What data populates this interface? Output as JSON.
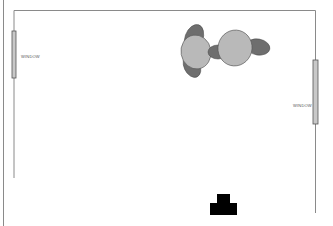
{
  "diagram": {
    "type": "floor-plan",
    "labels": {
      "window_left": "WINDOW",
      "window_right": "WINDOW"
    },
    "colors": {
      "wall": "#8a8a8a",
      "window_fill": "#c8c8c8",
      "window_stroke": "#555555",
      "chair_fill": "#6e6e6e",
      "table_fill": "#b9b9b9",
      "object_fill": "#000000"
    },
    "elements": [
      {
        "kind": "wall",
        "name": "outer-left-wall"
      },
      {
        "kind": "wall",
        "name": "top-wall"
      },
      {
        "kind": "wall",
        "name": "inner-left-wall"
      },
      {
        "kind": "wall",
        "name": "right-wall"
      },
      {
        "kind": "window",
        "name": "left-window",
        "label": "WINDOW"
      },
      {
        "kind": "window",
        "name": "right-window",
        "label": "WINDOW"
      },
      {
        "kind": "furniture",
        "name": "table-with-chairs-left"
      },
      {
        "kind": "furniture",
        "name": "table-with-chairs-right"
      },
      {
        "kind": "fixture",
        "name": "black-t-shaped-object"
      }
    ]
  }
}
